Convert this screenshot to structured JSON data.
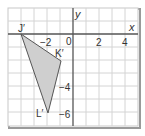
{
  "diagram": {
    "type": "coordinate-grid",
    "axes": {
      "x_label": "x",
      "y_label": "y",
      "origin_label": "0"
    },
    "x_ticks": [
      {
        "value": -2,
        "label": "−2"
      },
      {
        "value": 2,
        "label": "2"
      },
      {
        "value": 4,
        "label": "4"
      }
    ],
    "y_ticks": [
      {
        "value": -4,
        "label": "−4"
      },
      {
        "value": -6,
        "label": "−6"
      }
    ],
    "range": {
      "x": [
        -5,
        5
      ],
      "y": [
        -7,
        2
      ]
    },
    "shape": {
      "name": "triangle J'K'L'",
      "fill": "#cfcfcf",
      "stroke": "#555555",
      "vertices": [
        {
          "label": "J′",
          "x": -4,
          "y": 0
        },
        {
          "label": "K′",
          "x": -1,
          "y": -2
        },
        {
          "label": "L′",
          "x": -2,
          "y": -6
        }
      ]
    },
    "colors": {
      "grid": "#cccccc",
      "axis": "#555555",
      "border": "#888888"
    }
  }
}
